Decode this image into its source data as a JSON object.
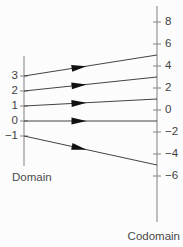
{
  "figure": {
    "background_color": "#fcfcfc",
    "line_color": "#2e2e2e",
    "axis_color": "#8a8a8a",
    "arrow_color": "#111111"
  },
  "domain_axis": {
    "caption": "Domain",
    "caption_x": 12,
    "caption_y": 172,
    "x": 24,
    "top_y": 56,
    "bottom_y": 166,
    "tick_labels": [
      "3",
      "2",
      "1",
      "0",
      "−1"
    ],
    "tick_values": [
      3,
      2,
      1,
      0,
      -1
    ],
    "tick_y": [
      76,
      91,
      106,
      121,
      136
    ],
    "label_x": 18
  },
  "codomain_axis": {
    "caption": "Codomain",
    "caption_x": 180,
    "caption_y": 231,
    "x": 157,
    "top_y": 6,
    "bottom_y": 222,
    "tick_labels": [
      "8",
      "6",
      "4",
      "2",
      "0",
      "−2",
      "−4",
      "−6"
    ],
    "tick_values": [
      8,
      6,
      4,
      2,
      0,
      -2,
      -4,
      -6
    ],
    "tick_y": [
      22,
      44,
      66,
      88,
      110,
      132,
      154,
      176
    ],
    "label_x": 165
  },
  "mappings": [
    {
      "name": "map-3-to-5",
      "domain_label": "3",
      "codomain_label": "5",
      "x1": 24,
      "y1": 76,
      "x2": 157,
      "y2": 55,
      "arrow_t": 0.47
    },
    {
      "name": "map-2-to-3",
      "domain_label": "2",
      "codomain_label": "3",
      "x1": 24,
      "y1": 91,
      "x2": 157,
      "y2": 77,
      "arrow_t": 0.47
    },
    {
      "name": "map-1-to-1",
      "domain_label": "1",
      "codomain_label": "1",
      "x1": 24,
      "y1": 106,
      "x2": 157,
      "y2": 99,
      "arrow_t": 0.47
    },
    {
      "name": "map-0-to-n1",
      "domain_label": "0",
      "codomain_label": "−1",
      "x1": 24,
      "y1": 121,
      "x2": 157,
      "y2": 121,
      "arrow_t": 0.47
    },
    {
      "name": "map-n1-to-n3",
      "domain_label": "−1",
      "codomain_label": "−3",
      "x1": 24,
      "y1": 136,
      "x2": 157,
      "y2": 165,
      "arrow_t": 0.47
    }
  ],
  "chart_data": {
    "type": "diagram",
    "rule": "f(x) = 2x - 1",
    "x": [
      3,
      2,
      1,
      0,
      -1
    ],
    "y": [
      5,
      3,
      1,
      -1,
      -3
    ],
    "pairs": [
      {
        "input": 3,
        "output": 5
      },
      {
        "input": 2,
        "output": 3
      },
      {
        "input": 1,
        "output": 1
      },
      {
        "input": 0,
        "output": -1
      },
      {
        "input": -1,
        "output": -3
      }
    ],
    "xlabel": "Domain",
    "ylabel": "Codomain",
    "domain_ticks": [
      3,
      2,
      1,
      0,
      -1
    ],
    "codomain_ticks": [
      8,
      6,
      4,
      2,
      0,
      -2,
      -4,
      -6
    ],
    "grid": false,
    "legend": "none"
  }
}
